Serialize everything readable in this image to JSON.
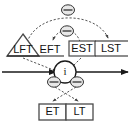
{
  "diagram": {
    "type": "activity-time-analysis-diagram",
    "nodes": {
      "lft": {
        "label": "LFT",
        "shape": "triangle",
        "description": "Latest Finish Time, enclosed in a triangle"
      },
      "eft": {
        "label": "EFT",
        "shape": "plain-text",
        "description": "Earliest Finish Time"
      },
      "est": {
        "label": "EST",
        "shape": "rectangle",
        "description": "Earliest Start Time, enclosed in a box"
      },
      "lst": {
        "label": "LST",
        "shape": "plain-text",
        "description": "Latest Start Time"
      },
      "activity": {
        "label": "i",
        "shape": "circle",
        "description": "Activity node i on the main timeline arrow"
      },
      "et": {
        "label": "ET",
        "shape": "rectangle-cell",
        "description": "Earliest Time cell"
      },
      "lt": {
        "label": "LT",
        "shape": "rectangle-cell",
        "description": "Latest Time cell"
      }
    },
    "operators": [
      {
        "name": "minus-operator-outer-arc",
        "symbol": "−",
        "position": "top-center"
      },
      {
        "name": "minus-operator-inner-arc",
        "symbol": "−",
        "position": "upper-center"
      },
      {
        "name": "minus-operator-left-of-activity",
        "symbol": "−",
        "position": "activity-left"
      },
      {
        "name": "minus-operator-right-of-activity",
        "symbol": "−",
        "position": "activity-right"
      }
    ],
    "connectors": [
      {
        "name": "outer-dashed-arc",
        "from": "lft",
        "to": "lst",
        "style": "dashed",
        "arrow": true
      },
      {
        "name": "inner-dashed-arc",
        "from": "est",
        "to": "eft",
        "style": "dashed",
        "arrow": true
      },
      {
        "name": "lft-to-activity",
        "from": "lft",
        "to": "activity",
        "style": "dashed",
        "arrow": true
      },
      {
        "name": "activity-left-to-lt",
        "from": "minus-operator-left-of-activity",
        "to": "lt",
        "style": "dashed",
        "arrow": true
      },
      {
        "name": "activity-right-to-et",
        "from": "minus-operator-right-of-activity",
        "to": "et",
        "style": "dashed",
        "arrow": true
      },
      {
        "name": "main-timeline",
        "from": "left-edge",
        "to": "right-edge",
        "style": "solid",
        "arrow": true
      }
    ],
    "colors": {
      "line": "#1a1a1a",
      "dashed_line": "#555555",
      "box_border": "#4a4a4a",
      "operator_fill": "#e8e8e8",
      "background": "#ffffff",
      "text": "#111111"
    }
  }
}
